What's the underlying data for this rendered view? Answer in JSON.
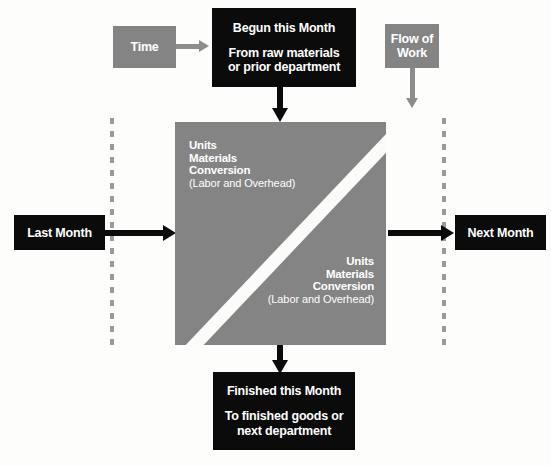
{
  "diagram": {
    "colors": {
      "black_box": "#0b0b0b",
      "gray_fill": "#848484",
      "white_stripe": "#fbfbfa",
      "dashed_line": "#9a9a9a",
      "background": "#fdfdfc"
    },
    "legend": {
      "time": {
        "label": "Time",
        "arrow": "right-arrow-gray"
      },
      "flow_of_work": {
        "line1": "Flow of",
        "line2": "Work",
        "arrow": "down-arrow-gray"
      }
    },
    "top_box": {
      "heading": "Begun this Month",
      "line1": "From raw materials",
      "line2": "or prior department"
    },
    "bottom_box": {
      "heading": "Finished this Month",
      "line1": "To finished goods or",
      "line2": "next department"
    },
    "left_box": {
      "label": "Last Month"
    },
    "right_box": {
      "label": "Next Month"
    },
    "center": {
      "upper_left": {
        "line1": "Units",
        "line2": "Materials",
        "line3": "Conversion",
        "note": "(Labor and Overhead)"
      },
      "lower_right": {
        "line1": "Units",
        "line2": "Materials",
        "line3": "Conversion",
        "note": "(Labor and Overhead)"
      }
    }
  }
}
